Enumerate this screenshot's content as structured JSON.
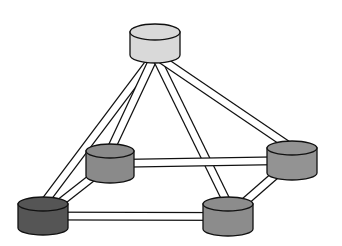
{
  "diagram": {
    "type": "network-topology",
    "colors": {
      "background": "#ffffff",
      "outline": "#111111",
      "link_fill": "#ffffff",
      "top_node": "#d9d9d9",
      "mid_node": "#8a8a8a",
      "right_node": "#939393",
      "bottom_right_node": "#8c8c8c",
      "bottom_left_node": "#555555"
    },
    "nodes": [
      {
        "id": "top",
        "cx": 155,
        "cy": 32,
        "rx": 25,
        "ry": 8,
        "h": 23,
        "color": "#d9d9d9"
      },
      {
        "id": "back-left",
        "cx": 110,
        "cy": 151,
        "rx": 24,
        "ry": 7,
        "h": 25,
        "color": "#8a8a8a"
      },
      {
        "id": "back-right",
        "cx": 292,
        "cy": 148,
        "rx": 25,
        "ry": 7,
        "h": 25,
        "color": "#939393"
      },
      {
        "id": "front-left",
        "cx": 43,
        "cy": 204,
        "rx": 25,
        "ry": 7,
        "h": 24,
        "color": "#555555"
      },
      {
        "id": "front-right",
        "cx": 228,
        "cy": 204,
        "rx": 25,
        "ry": 7,
        "h": 25,
        "color": "#8c8c8c"
      }
    ],
    "links": [
      {
        "from": "top",
        "to": "front-left"
      },
      {
        "from": "top",
        "to": "back-left"
      },
      {
        "from": "top",
        "to": "front-right"
      },
      {
        "from": "top",
        "to": "back-right"
      },
      {
        "from": "back-left",
        "to": "back-right"
      },
      {
        "from": "front-left",
        "to": "front-right"
      },
      {
        "from": "back-left",
        "to": "front-left"
      },
      {
        "from": "back-right",
        "to": "front-right"
      }
    ]
  }
}
